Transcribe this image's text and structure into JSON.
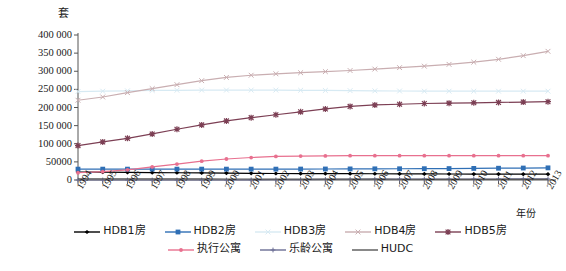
{
  "chart_data": {
    "type": "line",
    "title": "",
    "xlabel": "年份",
    "ylabel": "套",
    "ylim": [
      0,
      400000
    ],
    "ytick_values": [
      0,
      50000,
      100000,
      150000,
      200000,
      250000,
      300000,
      350000,
      400000
    ],
    "ytick_labels": [
      "0",
      "50000",
      "100 000",
      "150 000",
      "200 000",
      "250 000",
      "300 000",
      "350 000",
      "400 000"
    ],
    "grid": false,
    "legend_position": "bottom",
    "categories": [
      "1994",
      "1995",
      "1996",
      "1997",
      "1998",
      "1999",
      "2000",
      "2001",
      "2002",
      "2003",
      "2004",
      "2005",
      "2006",
      "2007",
      "2008",
      "2009",
      "2010",
      "2011",
      "2012",
      "2013"
    ],
    "series": [
      {
        "name": "HDB1房",
        "color": "#000000",
        "marker": "diamond",
        "values": [
          22000,
          21500,
          21000,
          20500,
          20000,
          19500,
          19000,
          18500,
          18000,
          17800,
          17600,
          17400,
          17200,
          17000,
          16800,
          16600,
          16400,
          16300,
          16200,
          16000
        ]
      },
      {
        "name": "HDB2房",
        "color": "#2f6fb5",
        "marker": "square",
        "values": [
          30000,
          30000,
          30000,
          30000,
          30000,
          30000,
          30000,
          30000,
          30000,
          30200,
          30400,
          30600,
          30800,
          31000,
          31200,
          31500,
          32000,
          32500,
          33000,
          33500
        ]
      },
      {
        "name": "HDB3房",
        "color": "#d7eaf3",
        "marker": "x",
        "values": [
          244000,
          245000,
          246000,
          247000,
          247500,
          248000,
          248000,
          248000,
          248000,
          247500,
          247000,
          246500,
          246000,
          245500,
          245000,
          245000,
          245000,
          245000,
          245000,
          245000
        ]
      },
      {
        "name": "HDB4房",
        "color": "#c9aeb1",
        "marker": "x",
        "values": [
          220000,
          229000,
          241000,
          252000,
          263000,
          274000,
          283000,
          289000,
          293000,
          296000,
          299000,
          302000,
          306000,
          310000,
          314000,
          319000,
          325000,
          333000,
          343000,
          355000
        ]
      },
      {
        "name": "HDB5房",
        "color": "#7c3f54",
        "marker": "star",
        "values": [
          95000,
          105000,
          115000,
          127000,
          140000,
          152000,
          163000,
          172000,
          180000,
          188000,
          196000,
          203000,
          207000,
          209000,
          211000,
          212000,
          213000,
          214000,
          215000,
          216000
        ]
      },
      {
        "name": "执行公寓",
        "color": "#e8708f",
        "marker": "dot",
        "values": [
          20000,
          23000,
          28000,
          36000,
          44000,
          52000,
          58000,
          62000,
          65000,
          66000,
          66500,
          67000,
          67000,
          67000,
          67000,
          67000,
          67000,
          67000,
          67000,
          67000
        ]
      },
      {
        "name": "乐龄公寓",
        "color": "#6b6d94",
        "marker": "plus",
        "values": [
          0,
          0,
          0,
          0,
          0,
          0,
          0,
          500,
          800,
          1200,
          1600,
          2000,
          2200,
          2400,
          2500,
          2600,
          2700,
          2800,
          2900,
          3000
        ]
      },
      {
        "name": "HUDC",
        "color": "#565656",
        "marker": "line",
        "values": [
          3000,
          3000,
          3000,
          3000,
          3000,
          2900,
          2800,
          2700,
          2600,
          2500,
          2400,
          2300,
          2200,
          2100,
          2000,
          1900,
          1800,
          1700,
          1600,
          1500
        ]
      }
    ]
  }
}
